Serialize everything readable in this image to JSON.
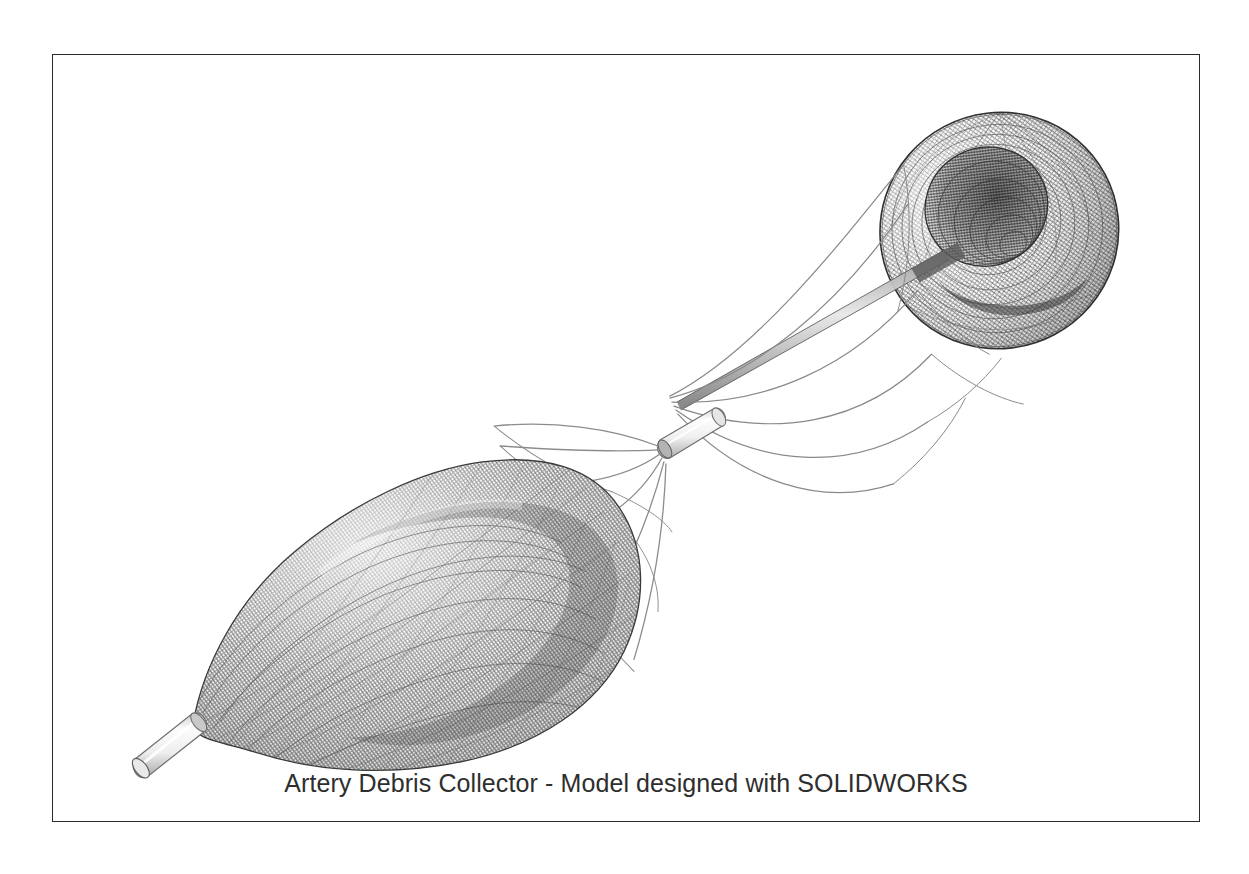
{
  "figure": {
    "caption": "Artery Debris Collector - Model designed with SOLIDWORKS",
    "frame_border_color": "#2b2b2b",
    "background_color": "#ffffff",
    "caption_color": "#2e2e2e"
  },
  "model": {
    "title": "Artery Debris Collector",
    "software": "SOLIDWORKS",
    "render_style": "wireframe-shaded-grayscale",
    "mesh_color": "#6a6a6a",
    "mesh_dark_color": "#3d3d3d",
    "wire_color": "#8d8d8d",
    "metal_light": "#f2f2f2",
    "metal_shadow": "#b9b9b9",
    "components": [
      {
        "name": "distal-funnel-basket",
        "label": "Funnel Capture Basket",
        "shape": "conical-funnel",
        "center_x": 1000,
        "center_y": 230,
        "radius_x": 120,
        "radius_y": 118
      },
      {
        "name": "proximal-collection-basket",
        "label": "Teardrop Collection Basket",
        "shape": "teardrop-mesh",
        "center_x": 390,
        "center_y": 570,
        "radius_x": 185,
        "radius_y": 135
      },
      {
        "name": "center-crimp-connector",
        "label": "Crimp Connector Tube",
        "shape": "cylinder",
        "x": 663,
        "y": 398,
        "length": 56,
        "width": 22
      },
      {
        "name": "distal-tip-cylinder",
        "label": "Atraumatic Distal Tip",
        "shape": "rounded-cylinder",
        "x": 128,
        "y": 712,
        "length": 62,
        "width": 22
      },
      {
        "name": "guide-shaft",
        "label": "Central Guide Shaft",
        "shape": "tapered-rod"
      },
      {
        "name": "strut-wires",
        "label": "Nitinol Strut Wires",
        "count": 6
      }
    ]
  }
}
